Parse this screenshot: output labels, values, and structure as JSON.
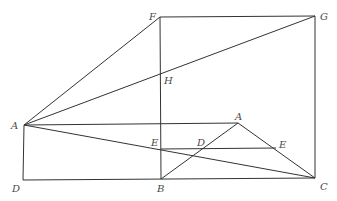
{
  "diagram": {
    "type": "geometric-figure",
    "stroke_color": "#333333",
    "label_color": "#4a4a4a",
    "points": {
      "F": {
        "label": "F",
        "x": 160,
        "y": 17,
        "lx": 149,
        "ly": 20
      },
      "G": {
        "label": "G",
        "x": 315,
        "y": 16,
        "lx": 320,
        "ly": 20
      },
      "H": {
        "label": "H",
        "x": 160,
        "y": 72,
        "lx": 164,
        "ly": 84
      },
      "A1": {
        "label": "A",
        "x": 24,
        "y": 125,
        "lx": 11,
        "ly": 129
      },
      "A2": {
        "label": "A",
        "x": 238,
        "y": 123,
        "lx": 235,
        "ly": 120
      },
      "E1": {
        "label": "E",
        "x": 161,
        "y": 149,
        "lx": 151,
        "ly": 146
      },
      "D1": {
        "label": "D",
        "x": 199,
        "y": 149,
        "lx": 197,
        "ly": 146
      },
      "E2": {
        "label": "E",
        "x": 276,
        "y": 148,
        "lx": 279,
        "ly": 148
      },
      "D2": {
        "label": "D",
        "x": 23,
        "y": 180,
        "lx": 12,
        "ly": 192
      },
      "B": {
        "label": "B",
        "x": 161,
        "y": 179,
        "lx": 157,
        "ly": 192
      },
      "C": {
        "label": "C",
        "x": 315,
        "y": 178,
        "lx": 320,
        "ly": 190
      }
    },
    "segments": [
      {
        "from": "F",
        "to": "G"
      },
      {
        "from": "G",
        "to": "C"
      },
      {
        "from": "F",
        "to": "B"
      },
      {
        "from": "A1",
        "to": "F"
      },
      {
        "from": "A1",
        "to": "G"
      },
      {
        "from": "A1",
        "to": "C"
      },
      {
        "from": "A1",
        "to": "A2"
      },
      {
        "from": "A1",
        "to": "D2"
      },
      {
        "from": "D2",
        "to": "C"
      },
      {
        "from": "B",
        "to": "A2"
      },
      {
        "from": "A2",
        "to": "C"
      },
      {
        "from": "E1",
        "to": "E2"
      }
    ]
  }
}
